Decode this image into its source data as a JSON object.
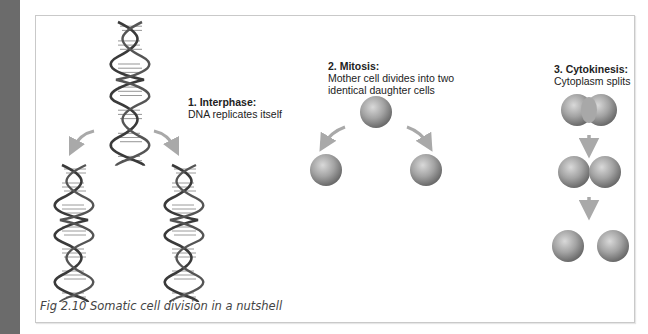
{
  "figure": {
    "caption": "Fig 2.10 Somatic cell division in a nutshell",
    "steps": [
      {
        "title": "1. Interphase:",
        "description": "DNA replicates itself"
      },
      {
        "title": "2. Mitosis:",
        "description_line1": "Mother cell divides into two",
        "description_line2": "identical daughter cells"
      },
      {
        "title": "3. Cytokinesis:",
        "description": "Cytoplasm splits"
      }
    ]
  },
  "colors": {
    "sidebar": "#6b6b6b",
    "frame_border": "#c9c9c9",
    "arrow": "#a9a9a9",
    "cell": "#8a8a8a"
  }
}
